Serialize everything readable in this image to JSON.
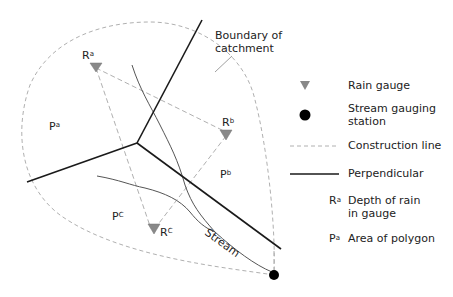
{
  "diagram": {
    "boundary_label_line1": "Boundary of",
    "boundary_label_line2": "catchment",
    "stream_label": "Stream",
    "gauges": [
      {
        "id": "a",
        "label": "R",
        "sup": "a"
      },
      {
        "id": "b",
        "label": "R",
        "sup": "b"
      },
      {
        "id": "c",
        "label": "R",
        "sup": "C"
      }
    ],
    "polygons": [
      {
        "id": "a",
        "label": "P",
        "sup": "a"
      },
      {
        "id": "b",
        "label": "P",
        "sup": "b"
      },
      {
        "id": "c",
        "label": "P",
        "sup": "C"
      }
    ]
  },
  "legend": {
    "items": [
      {
        "symbol": "triangle-icon",
        "label": "Rain gauge"
      },
      {
        "symbol": "filled-circle-icon",
        "label_line1": "Stream gauging",
        "label_line2": "station"
      },
      {
        "symbol": "dashed-line",
        "label": "Construction line"
      },
      {
        "symbol": "solid-line",
        "label": "Perpendicular"
      },
      {
        "symbol": "R",
        "sup": "a",
        "label_line1": "Depth of rain",
        "label_line2": "in gauge"
      },
      {
        "symbol": "P",
        "sup": "a",
        "label": "Area of polygon"
      }
    ]
  },
  "colors": {
    "construction_line": "#b0b0b0",
    "perpendicular": "#1a1a1a",
    "stream": "#555555",
    "gauge_fill": "#888888",
    "station_fill": "#000000"
  }
}
